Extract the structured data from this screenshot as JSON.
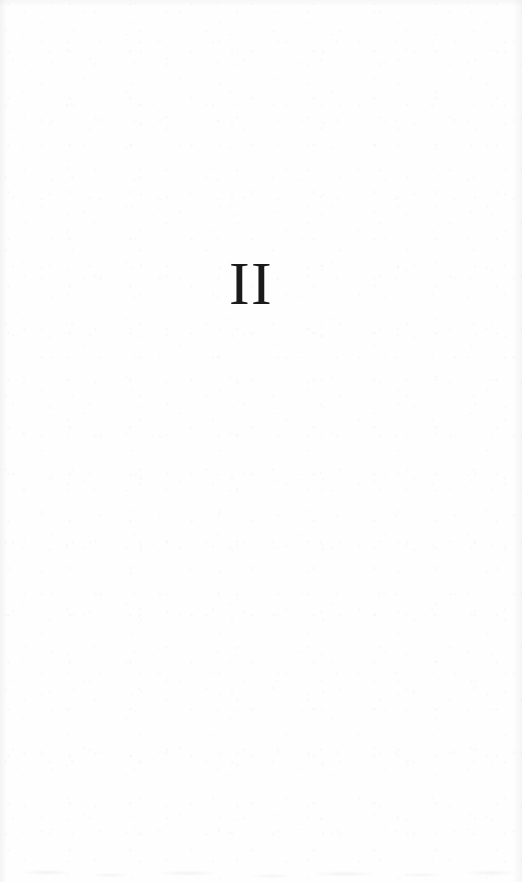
{
  "page": {
    "kind": "part-title-page",
    "part_numeral": "II",
    "body_text": "",
    "colors": {
      "paper": "#fefefe",
      "ink": "#1a1a1a",
      "scan_shadow": "#7d7d82"
    }
  }
}
